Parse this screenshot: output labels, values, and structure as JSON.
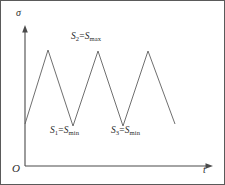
{
  "figure": {
    "axes": {
      "y_label": "σ",
      "x_label": "t",
      "origin_label": "O"
    },
    "annotations": {
      "peak_label": {
        "lead_var": "S",
        "lead_sub": "2",
        "equals": "=",
        "tail_var": "S",
        "tail_sub": "max"
      },
      "valley_label_1": {
        "lead_var": "S",
        "lead_sub": "1",
        "equals": "=",
        "tail_var": "S",
        "tail_sub": "min"
      },
      "valley_label_2": {
        "lead_var": "S",
        "lead_sub": "3",
        "equals": "=",
        "tail_var": "S",
        "tail_sub": "min"
      }
    },
    "colors": {
      "line": "#5f5f5f",
      "axis": "#4a4a4a",
      "border": "#5a5a5a",
      "text": "#2b2b2b",
      "background": "#ffffff"
    }
  },
  "chart_data": {
    "type": "line",
    "title": "",
    "xlabel": "t",
    "ylabel": "σ",
    "grid": false,
    "legend": null,
    "xlim": [
      0,
      225
    ],
    "ylim": [
      0,
      185
    ],
    "axis_origin_px": [
      25,
      166
    ],
    "y_axis_top_px": [
      25,
      26
    ],
    "x_axis_end_px": [
      212,
      166
    ],
    "series": [
      {
        "name": "cyclic-stress",
        "points_px": [
          [
            25,
            124
          ],
          [
            48,
            50
          ],
          [
            73,
            126
          ],
          [
            98,
            51
          ],
          [
            123,
            126
          ],
          [
            148,
            51
          ],
          [
            175,
            124
          ]
        ],
        "vertex_roles": [
          "start",
          "peak",
          "valley",
          "peak",
          "valley",
          "peak",
          "end"
        ]
      }
    ],
    "annotated_points": [
      {
        "role": "peak",
        "index": 3,
        "label": "S2=Smax"
      },
      {
        "role": "valley",
        "index": 2,
        "label": "S1=Smin"
      },
      {
        "role": "valley",
        "index": 4,
        "label": "S3=Smin"
      }
    ]
  }
}
